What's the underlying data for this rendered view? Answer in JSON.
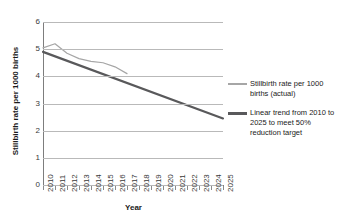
{
  "chart_data": {
    "type": "line",
    "title": "",
    "xlabel": "Year",
    "ylabel": "Stillbirth rate per 1000 births",
    "xlim": [
      2010,
      2025
    ],
    "ylim": [
      0,
      6
    ],
    "yticks": [
      6,
      5,
      4,
      3,
      2,
      1,
      0
    ],
    "grid": true,
    "legend_position": "right",
    "categories": [
      2010,
      2011,
      2012,
      2013,
      2014,
      2015,
      2016,
      2017,
      2018,
      2019,
      2020,
      2021,
      2022,
      2023,
      2024,
      2025
    ],
    "series": [
      {
        "name": "Stillbirth rate per 1000 births (actual)",
        "color": "#a6a6a6",
        "x": [
          2010,
          2011,
          2012,
          2013,
          2014,
          2015,
          2016,
          2017
        ],
        "values": [
          5.05,
          5.2,
          4.85,
          4.65,
          4.55,
          4.5,
          4.35,
          4.1
        ]
      },
      {
        "name": "Linear trend from 2010 to 2025 to meet 50% reduction target",
        "color": "#59595b",
        "x": [
          2010,
          2025
        ],
        "values": [
          4.9,
          2.45
        ]
      }
    ],
    "legend": [
      {
        "label": "Stillbirth rate per 1000 births (actual)",
        "color": "#a6a6a6",
        "style": "thin"
      },
      {
        "label": "Linear trend from 2010 to 2025 to meet 50% reduction target",
        "color": "#59595b",
        "style": "thick"
      }
    ],
    "xtick_labels": [
      "2010",
      "2011",
      "2012",
      "2013",
      "2014",
      "2015",
      "2016",
      "2017",
      "2018",
      "2019",
      "2020",
      "2021",
      "2022",
      "2023",
      "2024",
      "2025"
    ],
    "ytick_labels": [
      "6",
      "5",
      "4",
      "3",
      "2",
      "1",
      "0"
    ]
  }
}
